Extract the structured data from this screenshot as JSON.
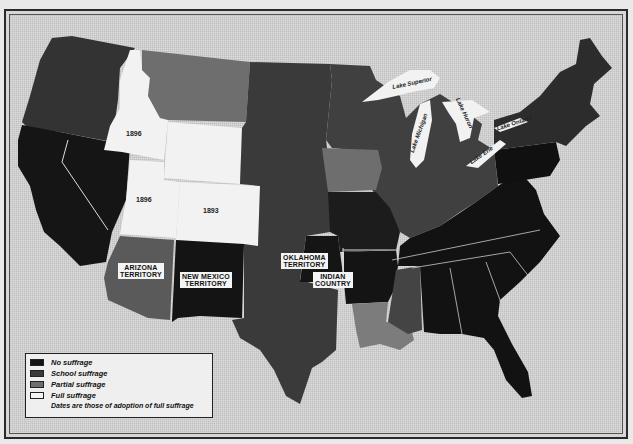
{
  "map": {
    "title": "Woman Suffrage in the United States (c. 1900)",
    "colors": {
      "no_suffrage": "#141414",
      "school_suffrage": "#3a3a3a",
      "partial_suffrage": "#6e6e6e",
      "full_suffrage": "#f4f4f4",
      "water": "#d2d2d2",
      "lakes": "#f2f2f2"
    },
    "region_labels": {
      "arizona": "ARIZONA TERRITORY",
      "arizona_line1": "ARIZONA",
      "arizona_line2": "TERRITORY",
      "new_mexico_line1": "NEW MEXICO",
      "new_mexico_line2": "TERRITORY",
      "oklahoma_line1": "OKLAHOMA",
      "oklahoma_line2": "TERRITORY",
      "indian_line1": "INDIAN",
      "indian_line2": "COUNTRY"
    },
    "years": {
      "idaho": "1896",
      "utah": "1896",
      "colorado": "1893"
    },
    "lakes": {
      "superior": "Lake Superior",
      "michigan": "Lake Michigan",
      "huron": "Lake Huron",
      "erie": "Lake Erie",
      "ontario": "Lake Ontario"
    }
  },
  "legend": {
    "items": [
      {
        "label": "No suffrage",
        "key": "no_suffrage"
      },
      {
        "label": "School suffrage",
        "key": "school_suffrage"
      },
      {
        "label": "Partial suffrage",
        "key": "partial_suffrage"
      },
      {
        "label": "Full suffrage",
        "key": "full_suffrage"
      }
    ],
    "note": "Dates are those of adoption of full suffrage"
  }
}
